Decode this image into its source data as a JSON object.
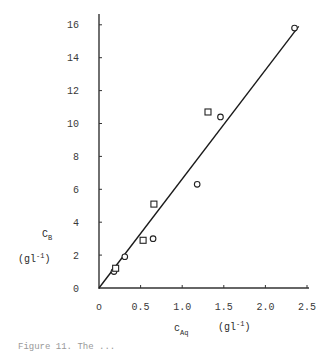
{
  "chart_data": {
    "type": "scatter",
    "title": "",
    "xlabel": "c_Aq (gl^-1)",
    "ylabel": "C_B (gl^-1)",
    "xlim": [
      0,
      2.5
    ],
    "ylim": [
      0,
      16.5
    ],
    "x_ticks": [
      "o",
      "0.5",
      "1.0",
      "1.5",
      "2.0",
      "2.5"
    ],
    "y_ticks": [
      "0",
      "2",
      "4",
      "6",
      "8",
      "10",
      "12",
      "14",
      "16"
    ],
    "grid": false,
    "legend": null,
    "series": [
      {
        "name": "circles",
        "marker": "circle",
        "points": [
          {
            "x": 0.18,
            "y": 1.0
          },
          {
            "x": 0.31,
            "y": 1.9
          },
          {
            "x": 0.65,
            "y": 3.0
          },
          {
            "x": 1.18,
            "y": 6.3
          },
          {
            "x": 1.46,
            "y": 10.4
          },
          {
            "x": 2.35,
            "y": 15.8
          }
        ]
      },
      {
        "name": "squares",
        "marker": "square",
        "points": [
          {
            "x": 0.2,
            "y": 1.2
          },
          {
            "x": 0.53,
            "y": 2.9
          },
          {
            "x": 0.66,
            "y": 5.1
          },
          {
            "x": 1.31,
            "y": 10.7
          }
        ]
      },
      {
        "name": "fit-line",
        "marker": "line",
        "points": [
          {
            "x": 0.0,
            "y": 0.0
          },
          {
            "x": 2.4,
            "y": 15.9
          }
        ]
      }
    ]
  },
  "labels": {
    "y_symbol": "C",
    "y_sub": "B",
    "y_unit_pre": "(gl",
    "y_unit_exp": "-1",
    "y_unit_post": ")",
    "x_symbol": "c",
    "x_sub": "Aq",
    "x_unit_pre": "(gl",
    "x_unit_exp": "-1",
    "x_unit_post": ")"
  },
  "caption": "Figure 11. The ..."
}
